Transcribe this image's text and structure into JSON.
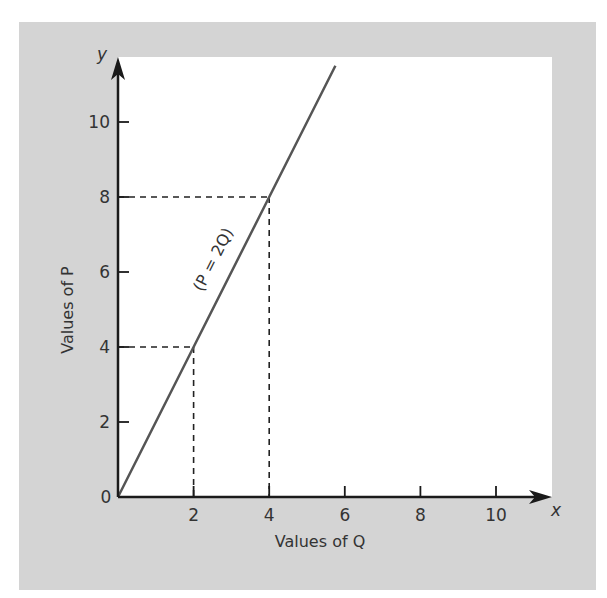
{
  "chart_data": {
    "type": "line",
    "title": "",
    "xlabel": "Values of Q",
    "ylabel": "Values of P",
    "x_axis_letter": "x",
    "y_axis_letter": "y",
    "xlim": [
      0,
      11.5
    ],
    "ylim": [
      0,
      11.5
    ],
    "x_ticks": [
      2,
      4,
      6,
      8,
      10
    ],
    "y_ticks": [
      2,
      4,
      6,
      8,
      10
    ],
    "origin_label": "0",
    "grid": false,
    "legend": null,
    "series": [
      {
        "name": "P = 2Q",
        "label": "(P = 2Q)",
        "x": [
          0,
          2,
          4,
          5.75
        ],
        "y": [
          0,
          4,
          8,
          11.5
        ]
      }
    ],
    "reference_points": [
      {
        "x": 2,
        "y": 4,
        "style": "dashed"
      },
      {
        "x": 4,
        "y": 8,
        "style": "dashed"
      }
    ]
  },
  "colors": {
    "frame": "#d4d4d4",
    "plot_area": "#ffffff",
    "axis": "#1a1a1a",
    "line": "#555555",
    "dashes": "#222222",
    "text": "#333333"
  }
}
